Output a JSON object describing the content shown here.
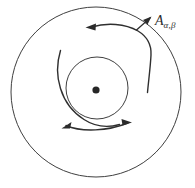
{
  "figure": {
    "kind": "geometric-diagram",
    "background_color": "#ffffff",
    "stroke_color": "#3a3a3a",
    "stroke_color_dark": "#262626",
    "annotations": {
      "region_label": {
        "base": "A",
        "subscript": "α,β",
        "full_text": "Aα,β",
        "icon_name": "region-label-A-alpha-beta"
      }
    },
    "shapes": {
      "outer_circle": {
        "name": "outer-circle",
        "center": [
          96,
          92
        ],
        "radius": 85,
        "stroke_width": 1
      },
      "inner_circle": {
        "name": "inner-circle",
        "center": [
          97,
          88
        ],
        "radius": 31,
        "stroke_width": 1
      },
      "center_dot": {
        "name": "center-dot",
        "center": [
          96,
          90
        ],
        "radius": 3.6,
        "fill": "#262626"
      },
      "spiral_arc": {
        "name": "spiral-arc",
        "description": "arc sweeping from upper-left outward of inner circle, down the left side, ending at the bottom double arrow",
        "start": [
          60,
          50
        ],
        "end": [
          120,
          124
        ]
      },
      "outer_arc_right": {
        "name": "outer-arc-right",
        "description": "arc from upper-middle sweeping right then down along inner side of outer circle",
        "start": [
          86,
          27
        ],
        "end": [
          148,
          93
        ]
      }
    },
    "arrows": [
      {
        "name": "arrow-upper-left-head",
        "direction": "left",
        "tip": [
          86,
          27
        ]
      },
      {
        "name": "arrow-upper-right-head",
        "direction": "up-right",
        "tip": [
          150,
          18
        ]
      },
      {
        "name": "arrow-bottom-left-head",
        "direction": "down-left",
        "tip": [
          62,
          128
        ]
      },
      {
        "name": "arrow-bottom-right-head",
        "direction": "right",
        "tip": [
          131,
          123
        ]
      }
    ]
  }
}
